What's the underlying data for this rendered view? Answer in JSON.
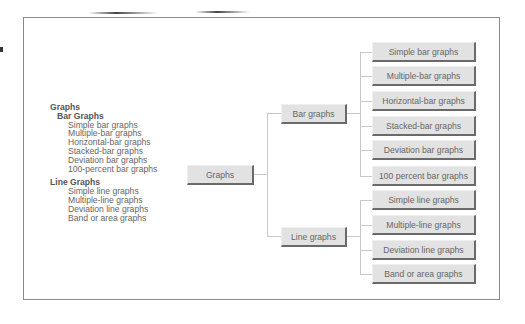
{
  "outline": {
    "root": "Graphs",
    "groups": [
      {
        "title": "Bar Graphs",
        "items": [
          "Simple bar graphs",
          "Multiple-bar graphs",
          "Horizontal-bar graphs",
          "Stacked-bar graphs",
          "Deviation bar graphs",
          "100-percent bar graphs"
        ]
      },
      {
        "title": "Line Graphs",
        "items": [
          "Simple line graphs",
          "Multiple-line graphs",
          "Deviation line graphs",
          "Band or area graphs"
        ]
      }
    ]
  },
  "tree": {
    "root": "Graphs",
    "branches": [
      {
        "label": "Bar graphs",
        "leaves": [
          "Simple bar graphs",
          "Multiple-bar graphs",
          "Horizontal-bar graphs",
          "Stacked-bar graphs",
          "Deviation bar graphs",
          "100 percent bar graphs"
        ]
      },
      {
        "label": "Line graphs",
        "leaves": [
          "Simple line graphs",
          "Multiple-line graphs",
          "Deviation line graphs",
          "Band or area graphs"
        ]
      }
    ]
  },
  "colors": {
    "box_fill": "#e2e2e2",
    "box_shadow": "#6a6a6a",
    "connector": "#c8c8c8",
    "frame": "#8a8a8a",
    "text": "#666666"
  }
}
